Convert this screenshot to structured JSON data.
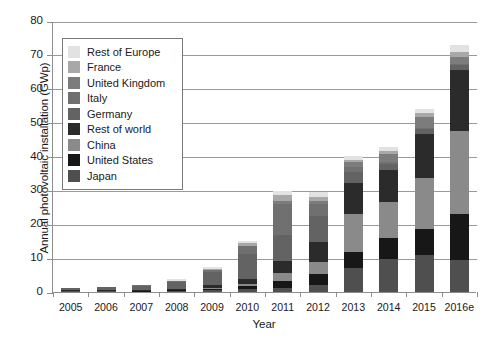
{
  "chart_data": {
    "type": "bar",
    "stacked": true,
    "title": "",
    "xlabel": "Year",
    "ylabel": "Annual photovoltaic installation (GWp)",
    "ylim": [
      0,
      80
    ],
    "yticks": [
      0,
      10,
      20,
      30,
      40,
      50,
      60,
      70,
      80
    ],
    "grid": "horizontal",
    "legend_position": "upper-left-inside",
    "categories": [
      "2005",
      "2006",
      "2007",
      "2008",
      "2009",
      "2010",
      "2011",
      "2012",
      "2013",
      "2014",
      "2015",
      "2016e"
    ],
    "series": [
      {
        "name": "Japan",
        "color": "#4f4f4f",
        "values": [
          0.3,
          0.3,
          0.2,
          0.2,
          0.5,
          1.0,
          1.3,
          2.0,
          7.0,
          9.7,
          11.0,
          9.5
        ]
      },
      {
        "name": "United States",
        "color": "#171717",
        "values": [
          0.1,
          0.1,
          0.2,
          0.3,
          0.5,
          0.9,
          1.9,
          3.3,
          4.8,
          6.2,
          7.5,
          13.5
        ]
      },
      {
        "name": "China",
        "color": "#8a8a8a",
        "values": [
          0.0,
          0.0,
          0.0,
          0.0,
          0.2,
          0.5,
          2.5,
          3.5,
          11.3,
          10.6,
          15.2,
          24.5
        ]
      },
      {
        "name": "Rest of world",
        "color": "#2b2b2b",
        "values": [
          0.1,
          0.1,
          0.2,
          0.4,
          0.8,
          1.5,
          3.5,
          6.0,
          9.0,
          9.5,
          13.0,
          18.0
        ]
      },
      {
        "name": "Germany",
        "color": "#636363",
        "values": [
          0.6,
          0.9,
          1.1,
          2.0,
          3.8,
          7.4,
          7.5,
          7.6,
          3.3,
          1.9,
          1.5,
          1.5
        ]
      },
      {
        "name": "Italy",
        "color": "#707070",
        "values": [
          0.0,
          0.0,
          0.1,
          0.3,
          0.7,
          2.3,
          9.3,
          3.6,
          1.4,
          0.4,
          0.3,
          0.4
        ]
      },
      {
        "name": "United Kingdom",
        "color": "#7c7c7c",
        "values": [
          0.0,
          0.0,
          0.0,
          0.0,
          0.0,
          0.1,
          0.8,
          0.9,
          1.5,
          2.3,
          3.3,
          2.0
        ]
      },
      {
        "name": "France",
        "color": "#a8a8a8",
        "values": [
          0.0,
          0.0,
          0.0,
          0.1,
          0.2,
          0.7,
          1.7,
          1.1,
          0.6,
          0.9,
          0.9,
          1.4
        ]
      },
      {
        "name": "Rest of Europe",
        "color": "#e2e2e2",
        "values": [
          0.0,
          0.0,
          0.0,
          0.5,
          0.8,
          0.8,
          1.3,
          1.5,
          1.3,
          1.2,
          1.2,
          2.2
        ]
      }
    ],
    "totals": [
      1.1,
      1.4,
      1.8,
      3.8,
      7.5,
      15.2,
      29.8,
      29.5,
      40.2,
      42.7,
      53.9,
      73.0
    ]
  },
  "axes": {
    "y_tick_labels": [
      "0",
      "10",
      "20",
      "30",
      "40",
      "50",
      "60",
      "70",
      "80"
    ],
    "x_tick_labels": [
      "2005",
      "2006",
      "2007",
      "2008",
      "2009",
      "2010",
      "2011",
      "2012",
      "2013",
      "2014",
      "2015",
      "2016e"
    ],
    "y_title": "Annual photovoltaic installation (GWp)",
    "x_title": "Year"
  },
  "legend": {
    "items": [
      {
        "label": "Rest of Europe",
        "color": "#e2e2e2"
      },
      {
        "label": "France",
        "color": "#a8a8a8"
      },
      {
        "label": "United Kingdom",
        "color": "#7c7c7c"
      },
      {
        "label": "Italy",
        "color": "#707070"
      },
      {
        "label": "Germany",
        "color": "#636363"
      },
      {
        "label": "Rest of world",
        "color": "#2b2b2b"
      },
      {
        "label": "China",
        "color": "#8a8a8a"
      },
      {
        "label": "United States",
        "color": "#171717"
      },
      {
        "label": "Japan",
        "color": "#4f4f4f"
      }
    ]
  },
  "style": {
    "grid_color": "#9a9a9a",
    "axis_color": "#8d8d8d",
    "text_color": "#1a1a1a",
    "background": "#ffffff"
  }
}
